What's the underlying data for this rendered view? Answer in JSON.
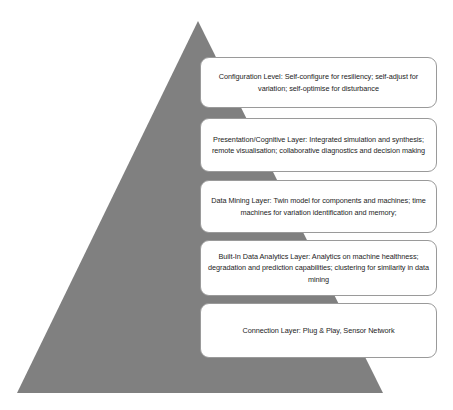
{
  "figure": {
    "type": "pyramid-diagram",
    "name": "5C Architecture Cyber-Physical System Pyramid",
    "background_color": "#ffffff",
    "pyramid": {
      "fill_color": "#808080",
      "apex": {
        "x": 198,
        "y": 21
      },
      "base_left": {
        "x": 17,
        "y": 393
      },
      "base_right": {
        "x": 383,
        "y": 393
      }
    },
    "box_style": {
      "fill_color": "#ffffff",
      "border_color": "#9a9a9a",
      "text_color": "#1c1c1c",
      "corner_radius": 9
    },
    "layers": [
      {
        "id": "configuration-level",
        "order": 1,
        "position_from_top": "top",
        "text": "Configuration Level: Self-configure for resiliency; self-adjust for variation; self-optimise for disturbance",
        "box": {
          "x": 200,
          "y": 57,
          "width": 237,
          "height": 51
        }
      },
      {
        "id": "presentation-cognitive-layer",
        "order": 2,
        "position_from_top": "second",
        "text": "Presentation/Cognitive Layer: Integrated simulation and synthesis; remote visualisation; collaborative diagnostics and decision making",
        "box": {
          "x": 200,
          "y": 118,
          "width": 237,
          "height": 54
        }
      },
      {
        "id": "data-mining-layer",
        "order": 3,
        "position_from_top": "third",
        "text": "Data Mining Layer: Twin model for components and machines; time machines for variation identification and memory;",
        "box": {
          "x": 200,
          "y": 180,
          "width": 237,
          "height": 53
        }
      },
      {
        "id": "built-in-data-analytics-layer",
        "order": 4,
        "position_from_top": "fourth",
        "text": "Built-In Data Analytics Layer: Analytics on machine healthness; degradation and prediction capabilities; clustering for similarity in data mining",
        "box": {
          "x": 200,
          "y": 240,
          "width": 237,
          "height": 56
        }
      },
      {
        "id": "connection-layer",
        "order": 5,
        "position_from_top": "bottom",
        "text": "Connection Layer: Plug & Play, Sensor Network",
        "box": {
          "x": 200,
          "y": 303,
          "width": 237,
          "height": 55
        }
      }
    ]
  }
}
